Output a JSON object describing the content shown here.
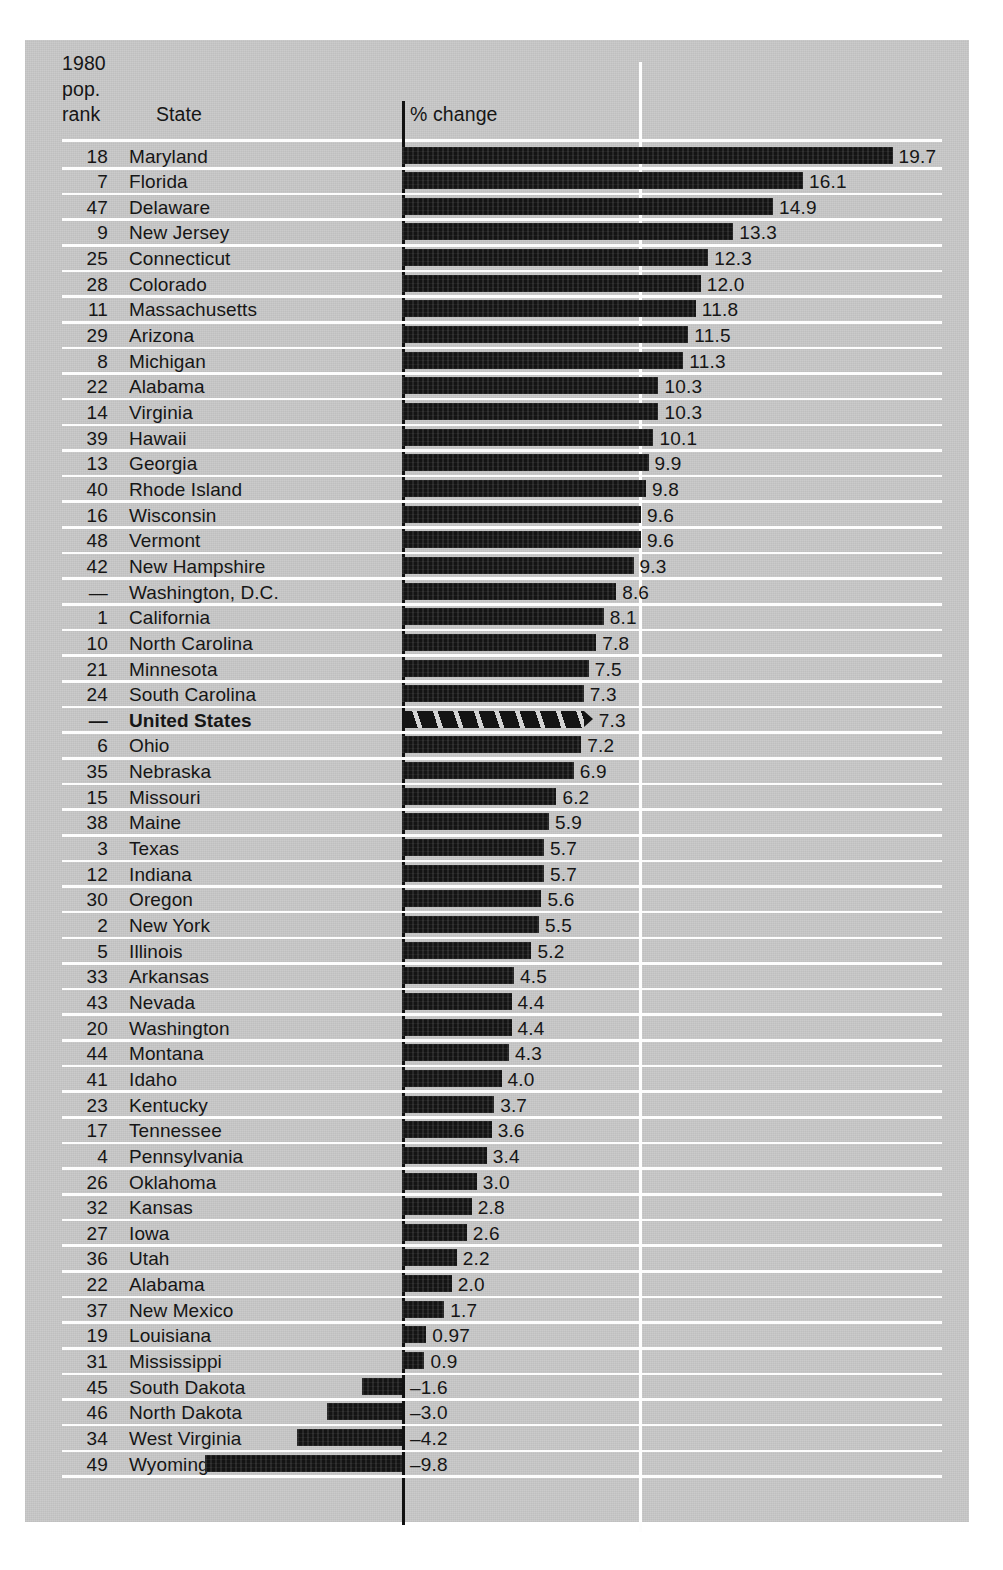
{
  "header": {
    "rank_label_line1": "1980",
    "rank_label_line2": "pop.",
    "rank_label_line3": "rank",
    "state_label": "State",
    "value_axis_label": "% change"
  },
  "colors": {
    "panel_background": "#c9c9c9",
    "bar_fill": "#141414",
    "gridline": "#fdfdfd",
    "axis": "#111111",
    "text": "#161616"
  },
  "chart_data": {
    "type": "bar",
    "orientation": "horizontal",
    "title": "",
    "xlabel": "% change",
    "ylabel": "State",
    "xlim": [
      -9.8,
      19.7
    ],
    "grid": true,
    "gridlines_at": [
      0,
      9.5
    ],
    "legend": "none",
    "columns": [
      "1980 pop. rank",
      "State",
      "% change"
    ],
    "axis_break_note": "Wyoming bar is truncated with a break mark",
    "rows": [
      {
        "rank": "18",
        "state": "Maryland",
        "value": 19.7,
        "label": "19.7"
      },
      {
        "rank": "7",
        "state": "Florida",
        "value": 16.1,
        "label": "16.1"
      },
      {
        "rank": "47",
        "state": "Delaware",
        "value": 14.9,
        "label": "14.9"
      },
      {
        "rank": "9",
        "state": "New Jersey",
        "value": 13.3,
        "label": "13.3"
      },
      {
        "rank": "25",
        "state": "Connecticut",
        "value": 12.3,
        "label": "12.3"
      },
      {
        "rank": "28",
        "state": "Colorado",
        "value": 12.0,
        "label": "12.0"
      },
      {
        "rank": "11",
        "state": "Massachusetts",
        "value": 11.8,
        "label": "11.8"
      },
      {
        "rank": "29",
        "state": "Arizona",
        "value": 11.5,
        "label": "11.5"
      },
      {
        "rank": "8",
        "state": "Michigan",
        "value": 11.3,
        "label": "11.3"
      },
      {
        "rank": "22",
        "state": "Alabama",
        "value": 10.3,
        "label": "10.3"
      },
      {
        "rank": "14",
        "state": "Virginia",
        "value": 10.3,
        "label": "10.3"
      },
      {
        "rank": "39",
        "state": "Hawaii",
        "value": 10.1,
        "label": "10.1"
      },
      {
        "rank": "13",
        "state": "Georgia",
        "value": 9.9,
        "label": "9.9"
      },
      {
        "rank": "40",
        "state": "Rhode Island",
        "value": 9.8,
        "label": "9.8"
      },
      {
        "rank": "16",
        "state": "Wisconsin",
        "value": 9.6,
        "label": "9.6"
      },
      {
        "rank": "48",
        "state": "Vermont",
        "value": 9.6,
        "label": "9.6"
      },
      {
        "rank": "42",
        "state": "New Hampshire",
        "value": 9.3,
        "label": "9.3"
      },
      {
        "rank": "—",
        "state": "Washington, D.C.",
        "value": 8.6,
        "label": "8.6"
      },
      {
        "rank": "1",
        "state": "California",
        "value": 8.1,
        "label": "8.1"
      },
      {
        "rank": "10",
        "state": "North Carolina",
        "value": 7.8,
        "label": "7.8"
      },
      {
        "rank": "21",
        "state": "Minnesota",
        "value": 7.5,
        "label": "7.5"
      },
      {
        "rank": "24",
        "state": "South Carolina",
        "value": 7.3,
        "label": "7.3"
      },
      {
        "rank": "—",
        "state": "United States",
        "value": 7.3,
        "label": "7.3",
        "style": "hatched",
        "emphasis": true
      },
      {
        "rank": "6",
        "state": "Ohio",
        "value": 7.2,
        "label": "7.2"
      },
      {
        "rank": "35",
        "state": "Nebraska",
        "value": 6.9,
        "label": "6.9"
      },
      {
        "rank": "15",
        "state": "Missouri",
        "value": 6.2,
        "label": "6.2"
      },
      {
        "rank": "38",
        "state": "Maine",
        "value": 5.9,
        "label": "5.9"
      },
      {
        "rank": "3",
        "state": "Texas",
        "value": 5.7,
        "label": "5.7"
      },
      {
        "rank": "12",
        "state": "Indiana",
        "value": 5.7,
        "label": "5.7"
      },
      {
        "rank": "30",
        "state": "Oregon",
        "value": 5.6,
        "label": "5.6"
      },
      {
        "rank": "2",
        "state": "New York",
        "value": 5.5,
        "label": "5.5"
      },
      {
        "rank": "5",
        "state": "Illinois",
        "value": 5.2,
        "label": "5.2"
      },
      {
        "rank": "33",
        "state": "Arkansas",
        "value": 4.5,
        "label": "4.5"
      },
      {
        "rank": "43",
        "state": "Nevada",
        "value": 4.4,
        "label": "4.4"
      },
      {
        "rank": "20",
        "state": "Washington",
        "value": 4.4,
        "label": "4.4"
      },
      {
        "rank": "44",
        "state": "Montana",
        "value": 4.3,
        "label": "4.3"
      },
      {
        "rank": "41",
        "state": "Idaho",
        "value": 4.0,
        "label": "4.0"
      },
      {
        "rank": "23",
        "state": "Kentucky",
        "value": 3.7,
        "label": "3.7"
      },
      {
        "rank": "17",
        "state": "Tennessee",
        "value": 3.6,
        "label": "3.6"
      },
      {
        "rank": "4",
        "state": "Pennsylvania",
        "value": 3.4,
        "label": "3.4"
      },
      {
        "rank": "26",
        "state": "Oklahoma",
        "value": 3.0,
        "label": "3.0"
      },
      {
        "rank": "32",
        "state": "Kansas",
        "value": 2.8,
        "label": "2.8"
      },
      {
        "rank": "27",
        "state": "Iowa",
        "value": 2.6,
        "label": "2.6"
      },
      {
        "rank": "36",
        "state": "Utah",
        "value": 2.2,
        "label": "2.2"
      },
      {
        "rank": "22",
        "state": "Alabama",
        "value": 2.0,
        "label": "2.0"
      },
      {
        "rank": "37",
        "state": "New Mexico",
        "value": 1.7,
        "label": "1.7"
      },
      {
        "rank": "19",
        "state": "Louisiana",
        "value": 0.97,
        "label": "0.97"
      },
      {
        "rank": "31",
        "state": "Mississippi",
        "value": 0.9,
        "label": "0.9"
      },
      {
        "rank": "45",
        "state": "South Dakota",
        "value": -1.6,
        "label": "–1.6"
      },
      {
        "rank": "46",
        "state": "North Dakota",
        "value": -3.0,
        "label": "–3.0"
      },
      {
        "rank": "34",
        "state": "West Virginia",
        "value": -4.2,
        "label": "–4.2"
      },
      {
        "rank": "49",
        "state": "Wyoming",
        "value": -9.8,
        "label": "–9.8",
        "truncated": true
      }
    ]
  }
}
